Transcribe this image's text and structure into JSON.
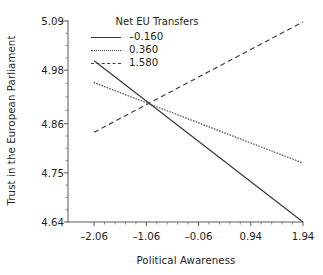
{
  "chart_data": {
    "type": "line",
    "title": "",
    "xlabel": "Political Awareness",
    "ylabel": "Trust in the European Parliament",
    "xlim": [
      -2.56,
      1.94
    ],
    "ylim": [
      4.64,
      5.09
    ],
    "xticks": [
      "-2.06",
      "-1.06",
      "-0.06",
      "0.94",
      "1.94"
    ],
    "xtick_values": [
      -2.06,
      -1.06,
      -0.06,
      0.94,
      1.94
    ],
    "yticks": [
      "4.64",
      "4.75",
      "4.86",
      "4.98",
      "5.09"
    ],
    "ytick_values": [
      4.64,
      4.75,
      4.86,
      4.98,
      5.09
    ],
    "grid": false,
    "legend_position": "top-center",
    "legend_title": "Net EU Transfers",
    "x": [
      -2.06,
      1.94
    ],
    "series": [
      {
        "name": "-0.160",
        "style": "solid",
        "color": "#3b3b3b",
        "values": [
          5.001,
          4.64
        ]
      },
      {
        "name": "0.360",
        "style": "dotted",
        "color": "#3b3b3b",
        "values": [
          4.952,
          4.772
        ]
      },
      {
        "name": "1.580",
        "style": "dashed",
        "color": "#3b3b3b",
        "values": [
          4.841,
          5.088
        ]
      }
    ]
  },
  "axis": {
    "x_title": "Political Awareness",
    "y_title": "Trust in the European Parliament"
  },
  "legend": {
    "title": "Net EU Transfers",
    "items": [
      {
        "label": "–0.160"
      },
      {
        "label": "0.360"
      },
      {
        "label": "1.580"
      }
    ]
  },
  "yticklabels": [
    "5.09",
    "4.98",
    "4.86",
    "4.75",
    "4.64"
  ],
  "xticklabels": [
    "–2.06",
    "–1.06",
    "–0.06",
    "0.94",
    "1.94"
  ]
}
